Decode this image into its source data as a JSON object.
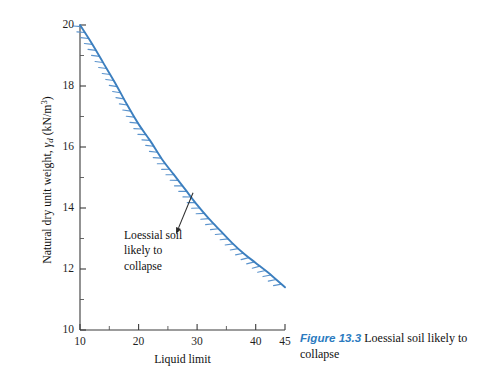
{
  "chart_data": {
    "type": "line",
    "title": "",
    "xlabel": "Liquid limit",
    "ylabel_plain": "Natural dry unit weight, γd (kN/m3)",
    "ylabel_prefix": "Natural dry unit weight, ",
    "ylabel_symbol": "γ",
    "ylabel_subscript": "d",
    "ylabel_units_open": " (kN/m",
    "ylabel_units_exp": "3",
    "ylabel_units_close": ")",
    "xlim": [
      10,
      45
    ],
    "ylim": [
      10,
      20
    ],
    "grid": false,
    "legend": "none",
    "x_ticks_major": [
      10,
      20,
      30,
      40,
      45
    ],
    "x_ticks_major_labels": [
      "10",
      "20",
      "30",
      "40",
      "45"
    ],
    "x_ticks_minor": [
      15,
      25,
      35
    ],
    "y_ticks_major": [
      10,
      12,
      14,
      16,
      18,
      20
    ],
    "y_ticks_major_labels": [
      "10",
      "12",
      "14",
      "16",
      "18",
      "20"
    ],
    "y_ticks_minor": [
      11,
      13,
      15,
      17,
      19
    ],
    "series": [
      {
        "name": "Collapse boundary",
        "color": "#3c7fbf",
        "hatched_side": "below-left",
        "x": [
          10,
          12,
          14,
          16,
          18,
          20,
          22,
          24,
          26,
          28,
          30,
          32,
          34,
          36,
          38,
          40,
          42,
          45
        ],
        "y": [
          20.0,
          19.4,
          18.75,
          18.1,
          17.4,
          16.75,
          16.2,
          15.6,
          15.1,
          14.6,
          14.1,
          13.65,
          13.25,
          12.85,
          12.5,
          12.2,
          11.9,
          11.4
        ]
      }
    ],
    "annotations": [
      {
        "name": "loessial-soil-annotation",
        "lines": [
          "Loessial soil",
          "likely to",
          "collapse"
        ],
        "arrow_from_x": 26.4,
        "arrow_from_y": 13.15,
        "arrow_to_x": 29.3,
        "arrow_to_y": 14.5
      }
    ],
    "colors": {
      "curve": "#3c7fbf",
      "hatch": "#5b93cc",
      "axis": "#3a3a3a",
      "text": "#111111",
      "caption_label": "#2b7bc0"
    }
  },
  "caption": {
    "label": "Figure 13.3",
    "text": " Loessial soil likely to collapse"
  }
}
